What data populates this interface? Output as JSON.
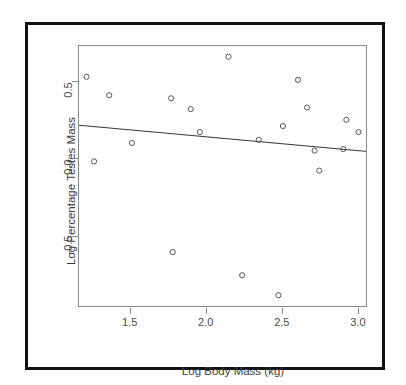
{
  "figure": {
    "background_color": "#ffffff",
    "frame_color": "#111111",
    "axis_color": "#8a8a8a",
    "point_color": "#555555",
    "line_color": "#333333"
  },
  "chart_data": {
    "type": "scatter",
    "title": "",
    "xlabel": "Log Body Mass (kg)",
    "ylabel": "Log Percentage Testes Mass",
    "xlim": [
      1.16,
      3.06
    ],
    "ylim": [
      -0.96,
      0.73
    ],
    "xticks": [
      1.5,
      2.0,
      2.5,
      3.0
    ],
    "xticklabels": [
      "1.5",
      "2.0",
      "2.5",
      "3.0"
    ],
    "yticks": [
      0.5,
      0.0,
      -0.5
    ],
    "yticklabels": [
      "0.5",
      "0.0",
      "-0.5"
    ],
    "grid": false,
    "legend": null,
    "marker": "open-circle",
    "points": [
      {
        "x": 1.21,
        "y": 0.53
      },
      {
        "x": 1.26,
        "y": -0.02
      },
      {
        "x": 1.36,
        "y": 0.41
      },
      {
        "x": 1.51,
        "y": 0.1
      },
      {
        "x": 1.77,
        "y": 0.39
      },
      {
        "x": 1.78,
        "y": -0.61
      },
      {
        "x": 1.9,
        "y": 0.32
      },
      {
        "x": 1.96,
        "y": 0.17
      },
      {
        "x": 2.15,
        "y": 0.66
      },
      {
        "x": 2.24,
        "y": -0.76
      },
      {
        "x": 2.35,
        "y": 0.12
      },
      {
        "x": 2.48,
        "y": -0.89
      },
      {
        "x": 2.51,
        "y": 0.21
      },
      {
        "x": 2.61,
        "y": 0.51
      },
      {
        "x": 2.67,
        "y": 0.33
      },
      {
        "x": 2.72,
        "y": 0.05
      },
      {
        "x": 2.75,
        "y": -0.08
      },
      {
        "x": 2.91,
        "y": 0.06
      },
      {
        "x": 2.93,
        "y": 0.25
      },
      {
        "x": 3.01,
        "y": 0.17
      }
    ],
    "fit_line": {
      "type": "linear-regression",
      "x_start": 1.16,
      "y_start": 0.215,
      "x_end": 3.06,
      "y_end": 0.045,
      "slope": -0.0895,
      "intercept": 0.3188
    }
  }
}
